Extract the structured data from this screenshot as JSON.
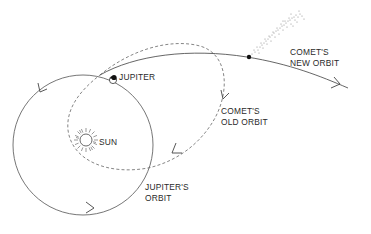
{
  "diagram": {
    "colors": {
      "stroke": "#555555",
      "text": "#2a2a2a",
      "background": "#ffffff",
      "planet": "#111111"
    },
    "labels": {
      "jupiter": "JUPITER",
      "sun": "SUN",
      "comet_new_orbit_line1": "COMET'S",
      "comet_new_orbit_line2": "NEW ORBIT",
      "comet_old_orbit_line1": "COMET'S",
      "comet_old_orbit_line2": "OLD ORBIT",
      "jupiter_orbit_line1": "JUPITER'S",
      "jupiter_orbit_line2": "ORBIT"
    },
    "elements": [
      {
        "id": "jupiter-orbit",
        "type": "circle",
        "style": "solid",
        "direction": "counterclockwise-in-image (arrows: top-left pointing down, bottom pointing right)"
      },
      {
        "id": "comet-old-orbit",
        "type": "ellipse",
        "style": "dashed",
        "encloses": "sun"
      },
      {
        "id": "comet-new-orbit",
        "type": "open curve",
        "style": "solid",
        "direction": "left-to-right"
      },
      {
        "id": "comet",
        "type": "point with dotted tail"
      },
      {
        "id": "jupiter",
        "type": "planet marker"
      },
      {
        "id": "sun",
        "type": "rayed circle"
      }
    ]
  }
}
